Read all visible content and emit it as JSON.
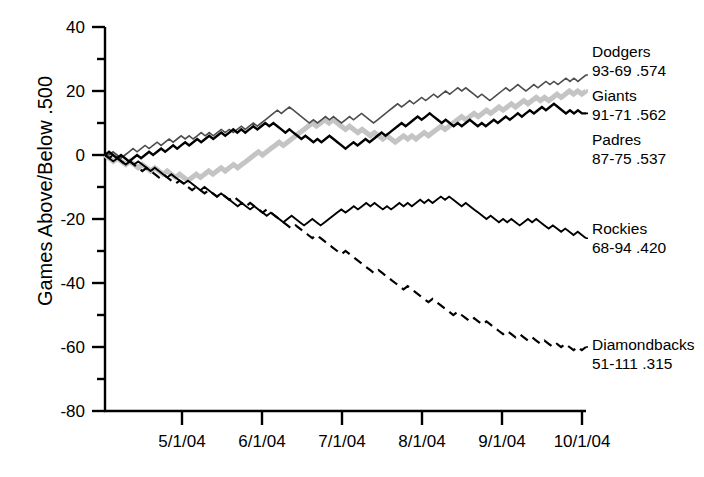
{
  "chart_data": {
    "type": "line",
    "title": "",
    "xlabel": "",
    "ylabel": "Games Above/Below .500",
    "ylim": [
      -80,
      40
    ],
    "ytick_values": [
      40,
      20,
      0,
      -20,
      -40,
      -60,
      -80
    ],
    "ytick_labels": [
      "40",
      "20",
      "0",
      "-20",
      "-40",
      "-60",
      "-80"
    ],
    "yminor_values": [
      30,
      10,
      -10,
      -30,
      -50,
      -70
    ],
    "xtick_labels": [
      "5/1/04",
      "6/1/04",
      "7/1/04",
      "8/1/04",
      "9/1/04",
      "10/1/04"
    ],
    "xlim_label_start": "4/5/04",
    "grid": false,
    "legend_position": "right-inline",
    "series": [
      {
        "name": "Dodgers",
        "record": "93-69 .574",
        "color": "#4d4d4d",
        "style": "solid",
        "width": 1.6,
        "end_value": 25,
        "values": [
          0,
          0,
          1,
          0,
          -1,
          0,
          1,
          2,
          1,
          2,
          3,
          2,
          3,
          4,
          3,
          4,
          5,
          4,
          5,
          6,
          5,
          6,
          5,
          6,
          7,
          6,
          7,
          6,
          7,
          8,
          7,
          8,
          7,
          8,
          9,
          8,
          9,
          10,
          9,
          10,
          11,
          12,
          13,
          14,
          13,
          14,
          15,
          14,
          13,
          12,
          11,
          10,
          11,
          10,
          11,
          12,
          11,
          12,
          11,
          10,
          11,
          12,
          11,
          12,
          13,
          12,
          11,
          10,
          11,
          12,
          13,
          14,
          15,
          16,
          15,
          16,
          17,
          16,
          17,
          18,
          17,
          18,
          19,
          18,
          19,
          20,
          19,
          20,
          21,
          20,
          21,
          20,
          19,
          18,
          19,
          18,
          17,
          18,
          19,
          20,
          21,
          20,
          21,
          22,
          21,
          20,
          21,
          22,
          21,
          22,
          23,
          22,
          23,
          22,
          23,
          24,
          23,
          24,
          23,
          24,
          25
        ]
      },
      {
        "name": "Giants",
        "record": "91-71 .562",
        "color": "#000000",
        "style": "solid",
        "width": 2.4,
        "end_value": 13,
        "values": [
          0,
          1,
          0,
          -1,
          0,
          -1,
          -2,
          -1,
          0,
          -1,
          0,
          1,
          0,
          1,
          2,
          1,
          2,
          3,
          2,
          3,
          4,
          3,
          4,
          5,
          4,
          5,
          6,
          5,
          6,
          7,
          6,
          7,
          8,
          7,
          8,
          7,
          8,
          9,
          8,
          9,
          10,
          9,
          10,
          9,
          8,
          7,
          8,
          7,
          6,
          5,
          6,
          5,
          4,
          5,
          4,
          5,
          6,
          5,
          4,
          3,
          2,
          3,
          4,
          3,
          4,
          5,
          4,
          5,
          6,
          7,
          6,
          7,
          8,
          9,
          10,
          9,
          10,
          11,
          12,
          11,
          12,
          13,
          12,
          11,
          10,
          11,
          10,
          9,
          10,
          9,
          10,
          11,
          10,
          9,
          10,
          9,
          10,
          11,
          10,
          11,
          12,
          11,
          12,
          13,
          12,
          13,
          14,
          13,
          14,
          15,
          14,
          15,
          16,
          15,
          14,
          13,
          14,
          13,
          14,
          13,
          13
        ]
      },
      {
        "name": "Padres",
        "record": "87-75 .537",
        "color": "#c4c4c4",
        "style": "solid",
        "width": 5.0,
        "end_value": 20,
        "values": [
          0,
          -1,
          -2,
          -1,
          -2,
          -3,
          -2,
          -3,
          -4,
          -3,
          -4,
          -5,
          -4,
          -5,
          -6,
          -5,
          -6,
          -7,
          -6,
          -7,
          -8,
          -7,
          -6,
          -7,
          -6,
          -5,
          -6,
          -5,
          -4,
          -5,
          -4,
          -3,
          -4,
          -3,
          -2,
          -1,
          0,
          1,
          0,
          1,
          2,
          3,
          4,
          3,
          4,
          5,
          6,
          7,
          8,
          9,
          10,
          9,
          10,
          11,
          10,
          11,
          10,
          9,
          8,
          9,
          8,
          7,
          8,
          7,
          6,
          7,
          6,
          5,
          6,
          5,
          4,
          5,
          6,
          5,
          6,
          5,
          6,
          7,
          6,
          7,
          8,
          9,
          8,
          9,
          10,
          11,
          12,
          11,
          12,
          13,
          12,
          13,
          14,
          13,
          14,
          15,
          14,
          15,
          16,
          15,
          16,
          17,
          16,
          17,
          18,
          17,
          18,
          17,
          18,
          19,
          18,
          19,
          20,
          19,
          20,
          19,
          20
        ]
      },
      {
        "name": "Rockies",
        "record": "68-94 .420",
        "color": "#000000",
        "style": "solid",
        "width": 1.9,
        "end_value": -26,
        "values": [
          0,
          -1,
          -2,
          -1,
          -2,
          -3,
          -2,
          -3,
          -2,
          -3,
          -4,
          -5,
          -4,
          -5,
          -6,
          -7,
          -6,
          -7,
          -8,
          -9,
          -8,
          -9,
          -10,
          -11,
          -10,
          -11,
          -12,
          -13,
          -12,
          -13,
          -14,
          -15,
          -16,
          -15,
          -16,
          -17,
          -16,
          -17,
          -18,
          -19,
          -18,
          -19,
          -20,
          -21,
          -20,
          -19,
          -20,
          -21,
          -22,
          -21,
          -20,
          -21,
          -22,
          -21,
          -20,
          -19,
          -18,
          -17,
          -18,
          -17,
          -16,
          -17,
          -16,
          -15,
          -16,
          -15,
          -16,
          -17,
          -16,
          -17,
          -16,
          -15,
          -16,
          -15,
          -16,
          -15,
          -14,
          -15,
          -14,
          -15,
          -14,
          -13,
          -14,
          -13,
          -14,
          -15,
          -16,
          -15,
          -16,
          -17,
          -18,
          -19,
          -20,
          -19,
          -20,
          -21,
          -20,
          -21,
          -20,
          -21,
          -22,
          -21,
          -20,
          -21,
          -20,
          -21,
          -22,
          -23,
          -22,
          -23,
          -24,
          -23,
          -24,
          -25,
          -24,
          -25,
          -26
        ]
      },
      {
        "name": "Diamondbacks",
        "record": "51-111 .315",
        "color": "#000000",
        "style": "dashed",
        "width": 2.2,
        "end_value": -60,
        "values": [
          0,
          -1,
          0,
          -1,
          -2,
          -3,
          -2,
          -3,
          -4,
          -5,
          -4,
          -5,
          -6,
          -7,
          -6,
          -7,
          -8,
          -9,
          -8,
          -9,
          -10,
          -11,
          -10,
          -11,
          -12,
          -11,
          -12,
          -13,
          -12,
          -13,
          -14,
          -13,
          -14,
          -15,
          -16,
          -15,
          -16,
          -17,
          -18,
          -17,
          -18,
          -19,
          -20,
          -21,
          -22,
          -23,
          -22,
          -23,
          -24,
          -25,
          -26,
          -25,
          -26,
          -27,
          -28,
          -29,
          -30,
          -31,
          -30,
          -31,
          -32,
          -33,
          -34,
          -35,
          -36,
          -37,
          -36,
          -37,
          -38,
          -39,
          -40,
          -41,
          -42,
          -41,
          -42,
          -43,
          -44,
          -45,
          -46,
          -45,
          -46,
          -47,
          -48,
          -49,
          -50,
          -49,
          -50,
          -51,
          -52,
          -51,
          -52,
          -53,
          -52,
          -53,
          -54,
          -55,
          -56,
          -55,
          -56,
          -57,
          -56,
          -57,
          -58,
          -57,
          -58,
          -59,
          -58,
          -59,
          -60,
          -59,
          -60,
          -59,
          -60,
          -61,
          -60,
          -61,
          -60
        ]
      }
    ]
  },
  "labels": {
    "dodgers_name": "Dodgers",
    "dodgers_record": "93-69 .574",
    "giants_name": "Giants",
    "giants_record": "91-71 .562",
    "padres_name": "Padres",
    "padres_record": "87-75 .537",
    "rockies_name": "Rockies",
    "rockies_record": "68-94 .420",
    "dbacks_name": "Diamondbacks",
    "dbacks_record": "51-111 .315"
  },
  "axes": {
    "y_title": "Games Above/Below .500",
    "y_ticks": [
      "40",
      "20",
      "0",
      "-20",
      "-40",
      "-60",
      "-80"
    ],
    "x_ticks": [
      "5/1/04",
      "6/1/04",
      "7/1/04",
      "8/1/04",
      "9/1/04",
      "10/1/04"
    ]
  }
}
